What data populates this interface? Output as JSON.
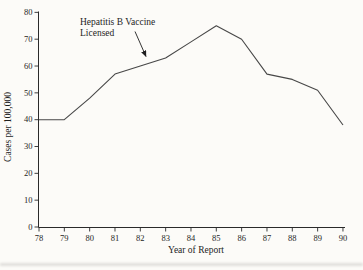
{
  "chart_data": {
    "type": "line",
    "title": "",
    "xlabel": "Year of Report",
    "ylabel": "Cases per 100,000",
    "categories": [
      "78",
      "79",
      "80",
      "81",
      "82",
      "83",
      "84",
      "85",
      "86",
      "87",
      "88",
      "89",
      "90"
    ],
    "y_ticks": [
      0,
      10,
      20,
      30,
      40,
      50,
      60,
      70,
      80
    ],
    "ylim": [
      0,
      80
    ],
    "grid": false,
    "legend": "none",
    "series": [
      {
        "name": "Hepatitis B cases per 100,000",
        "values": [
          40,
          40,
          48,
          57,
          60,
          63,
          69,
          75,
          70,
          57,
          55,
          51,
          38
        ]
      }
    ],
    "annotation": {
      "line1": "Hepatitis B Vaccine",
      "line2": "Licensed",
      "arrow_points_between": [
        "82",
        "83"
      ]
    },
    "colors": {
      "line": "#474747",
      "text": "#1e1e1e",
      "background": "#fcfbf8"
    }
  }
}
